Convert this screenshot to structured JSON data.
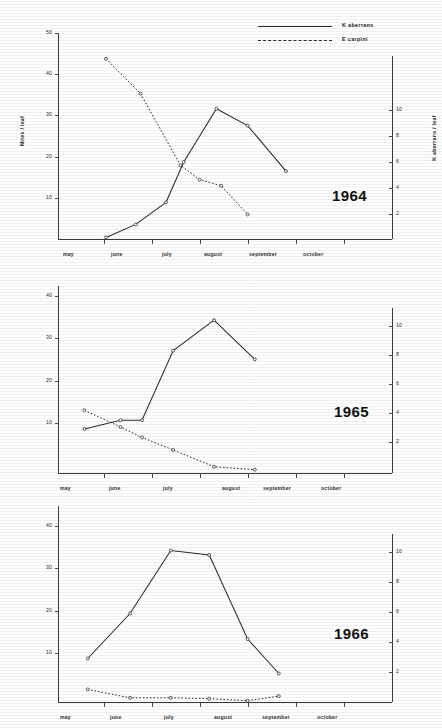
{
  "figure": {
    "axis_labels": {
      "left": "Mites / leaf",
      "right": "K aberrans / leaf",
      "months": [
        "may",
        "june",
        "july",
        "august",
        "september",
        "october"
      ]
    },
    "legend": {
      "entries": [
        {
          "label": "K aberrans",
          "style": "solid"
        },
        {
          "label": "E carpini",
          "style": "dotted"
        }
      ]
    },
    "panels": [
      {
        "year": "1964"
      },
      {
        "year": "1965"
      },
      {
        "year": "1966"
      }
    ]
  },
  "chart_data": [
    {
      "type": "line",
      "title": "1964",
      "xlabel": "",
      "ylabel": "Mites / leaf",
      "ylabel_right": "K aberrans / leaf",
      "grid": false,
      "legend_position": "top-right",
      "xlim": [
        0,
        6
      ],
      "ylim": [
        0,
        52
      ],
      "ylim_right": [
        0,
        15.2
      ],
      "yticks": [
        10,
        20,
        30,
        40,
        50
      ],
      "yticks_right": [
        2,
        4,
        6,
        8,
        10
      ],
      "xtick_labels": [
        "may",
        "june",
        "july",
        "august",
        "september",
        "october"
      ],
      "series": [
        {
          "name": "K aberrans",
          "style": "solid",
          "axis": "right",
          "x": [
            1.0,
            1.62,
            2.25,
            2.62,
            3.3,
            3.95,
            4.75
          ],
          "values": [
            0.2,
            1.2,
            2.9,
            6.0,
            10.1,
            8.8,
            5.3
          ],
          "values_left_scale": [
            0.8,
            4.0,
            9.6,
            20.0,
            34.0,
            29.5,
            17.5
          ]
        },
        {
          "name": "E carpini",
          "style": "dotted",
          "axis": "left",
          "x": [
            1.0,
            1.72,
            2.55,
            2.95,
            3.4,
            3.95
          ],
          "values": [
            44.0,
            35.5,
            18.0,
            14.5,
            13.0,
            6.0
          ]
        }
      ]
    },
    {
      "type": "line",
      "title": "1965",
      "xlabel": "",
      "ylabel": "Mites / leaf",
      "ylabel_right": "K aberrans / leaf",
      "grid": false,
      "legend_position": "none",
      "xlim": [
        0,
        6
      ],
      "ylim": [
        0,
        44
      ],
      "ylim_right": [
        0,
        13
      ],
      "yticks": [
        10,
        20,
        30,
        40
      ],
      "yticks_right": [
        2,
        4,
        6,
        8,
        10
      ],
      "xtick_labels": [
        "may",
        "june",
        "july",
        "august",
        "september",
        "october"
      ],
      "series": [
        {
          "name": "K aberrans",
          "style": "solid",
          "axis": "right",
          "x": [
            0.55,
            1.3,
            1.75,
            2.4,
            3.25,
            4.1
          ],
          "values": [
            2.9,
            3.5,
            3.5,
            8.3,
            10.4,
            7.7
          ],
          "values_left_scale": [
            10.0,
            11.8,
            12.0,
            28.0,
            35.0,
            26.0
          ]
        },
        {
          "name": "E carpini",
          "style": "dotted",
          "axis": "left",
          "x": [
            0.55,
            1.3,
            1.75,
            2.4,
            3.25,
            4.1
          ],
          "values": [
            15.0,
            11.0,
            8.5,
            5.5,
            1.5,
            0.8
          ]
        }
      ]
    },
    {
      "type": "line",
      "title": "1966",
      "xlabel": "",
      "ylabel": "Mites / leaf",
      "ylabel_right": "K aberrans / leaf",
      "grid": false,
      "legend_position": "none",
      "xlim": [
        0,
        6
      ],
      "ylim": [
        0,
        44
      ],
      "ylim_right": [
        0,
        13
      ],
      "yticks": [
        10,
        20,
        30,
        40
      ],
      "yticks_right": [
        2,
        4,
        6,
        8,
        10
      ],
      "xtick_labels": [
        "may",
        "june",
        "july",
        "august",
        "september",
        "october"
      ],
      "series": [
        {
          "name": "K aberrans",
          "style": "solid",
          "axis": "right",
          "x": [
            0.62,
            1.5,
            2.35,
            3.15,
            3.95,
            4.6
          ],
          "values": [
            2.9,
            5.9,
            10.1,
            9.8,
            4.2,
            1.9
          ],
          "values_left_scale": [
            10.0,
            20.0,
            34.0,
            33.0,
            14.5,
            6.5
          ]
        },
        {
          "name": "E carpini",
          "style": "dotted",
          "axis": "left",
          "x": [
            0.62,
            1.5,
            2.35,
            3.15,
            3.95,
            4.6
          ],
          "values": [
            3.0,
            1.0,
            1.0,
            0.8,
            0.3,
            1.4
          ]
        }
      ]
    }
  ]
}
